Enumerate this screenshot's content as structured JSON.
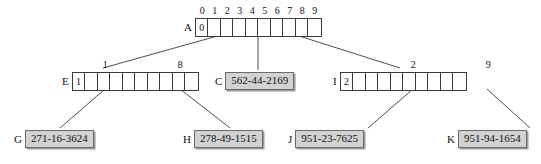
{
  "diagram": {
    "colors": {
      "leaf_fill": "#d2d2d2",
      "leaf_border": "#6a6a6a",
      "leaf_shadow": "#9a9a9a",
      "node_border": "#3a3a3a",
      "background": "#ffffff",
      "text": "#111111"
    },
    "root_indices": [
      "0",
      "1",
      "2",
      "3",
      "4",
      "5",
      "6",
      "7",
      "8",
      "9"
    ],
    "nodes": [
      {
        "id": "A",
        "label": "A",
        "cells": [
          "0",
          "",
          "",
          "",
          "",
          "",
          "",
          "",
          "",
          ""
        ],
        "captions": []
      },
      {
        "id": "E",
        "label": "E",
        "cells": [
          "1",
          "",
          "",
          "",
          "",
          "",
          "",
          "",
          "",
          ""
        ],
        "captions": [
          {
            "text": "1",
            "cell": 2
          },
          {
            "text": "8",
            "cell": 8
          }
        ]
      },
      {
        "id": "I",
        "label": "I",
        "cells": [
          "2",
          "",
          "",
          "",
          "",
          "",
          "",
          "",
          "",
          ""
        ],
        "captions": [
          {
            "text": "2",
            "cell": 3
          },
          {
            "text": "9",
            "cell": 9
          }
        ]
      }
    ],
    "leaves": [
      {
        "id": "C",
        "label": "C",
        "value": "562-44-2169"
      },
      {
        "id": "G",
        "label": "G",
        "value": "271-16-3624"
      },
      {
        "id": "H",
        "label": "H",
        "value": "278-49-1515"
      },
      {
        "id": "J",
        "label": "J",
        "value": "951-23-7625"
      },
      {
        "id": "K",
        "label": "K",
        "value": "951-94-1654"
      }
    ],
    "edges": [
      {
        "from": "A",
        "to": "E"
      },
      {
        "from": "A",
        "to": "C"
      },
      {
        "from": "A",
        "to": "I"
      },
      {
        "from": "E",
        "to": "G"
      },
      {
        "from": "E",
        "to": "H"
      },
      {
        "from": "I",
        "to": "J"
      },
      {
        "from": "I",
        "to": "K"
      }
    ]
  }
}
